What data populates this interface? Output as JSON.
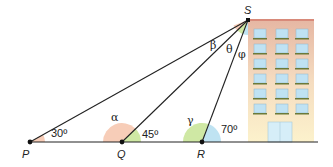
{
  "points": {
    "P": "P",
    "Q": "Q",
    "R": "R",
    "S": "S"
  },
  "angles": {
    "at_P": "30º",
    "at_Q": "45º",
    "at_R": "70º",
    "alpha": "α",
    "beta": "β",
    "gamma": "γ",
    "theta": "θ",
    "phi": "φ"
  },
  "colors": {
    "arc_pink": "#f7cdb8",
    "arc_green": "#cfe8a4",
    "arc_blue": "#bfe3f2",
    "building_top": "#e8b8a4",
    "building_bottom": "#fbf0c8",
    "line": "#222222"
  }
}
